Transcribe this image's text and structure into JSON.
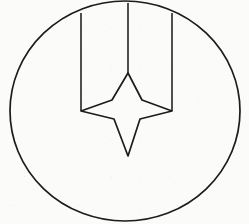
{
  "figure": {
    "title": "Line drawing: four-pointed star within a circle",
    "background_color": "#fbfbfa",
    "stroke_color": "#1c1c1c",
    "stroke_width": 1.7,
    "width": 249,
    "height": 224
  },
  "shapes": {
    "circle": {
      "name": "outer-circle",
      "center_x": 125,
      "center_y": 111,
      "radius_x": 115,
      "radius_y": 110,
      "clipped_top": true,
      "clipped_bottom": true
    },
    "vertical_lines": [
      {
        "name": "left-vertical-line",
        "x": 81,
        "y_top": 13,
        "y_bottom": 111
      },
      {
        "name": "center-vertical-line",
        "x": 128,
        "y_top": 3,
        "y_bottom": 73
      },
      {
        "name": "right-vertical-line",
        "x": 172,
        "y_top": 13,
        "y_bottom": 111
      }
    ],
    "star": {
      "name": "four-pointed-star",
      "points": 4,
      "outer_vertices": [
        {
          "label": "top",
          "x": 128,
          "y": 73
        },
        {
          "label": "right",
          "x": 172,
          "y": 111
        },
        {
          "label": "bottom",
          "x": 128,
          "y": 156
        },
        {
          "label": "left",
          "x": 81,
          "y": 111
        }
      ],
      "inner_vertices": [
        {
          "label": "upper-right",
          "x": 142,
          "y": 100
        },
        {
          "label": "lower-right",
          "x": 140,
          "y": 119
        },
        {
          "label": "lower-left",
          "x": 114,
          "y": 119
        },
        {
          "label": "upper-left",
          "x": 112,
          "y": 100
        }
      ],
      "path": "M 128 73 L 142 100 L 172 111 L 140 119 L 128 156 L 114 119 L 81 111 L 112 100 Z"
    }
  }
}
